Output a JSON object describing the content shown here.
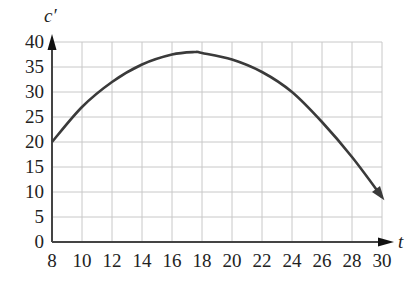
{
  "chart_data": {
    "type": "line",
    "title": "",
    "xlabel": "t",
    "ylabel": "c′",
    "xlim": [
      8,
      30
    ],
    "ylim": [
      0,
      40
    ],
    "x_ticks": [
      "8",
      "10",
      "12",
      "14",
      "16",
      "18",
      "20",
      "22",
      "24",
      "26",
      "28",
      "30"
    ],
    "y_ticks": [
      "0",
      "5",
      "10",
      "15",
      "20",
      "25",
      "30",
      "35",
      "40"
    ],
    "grid": true,
    "legend": null,
    "series": [
      {
        "name": "c′(t)",
        "x": [
          8,
          10,
          12,
          14,
          16,
          17.5,
          18,
          20,
          22,
          24,
          26,
          28,
          30
        ],
        "values": [
          20,
          27,
          32,
          35.5,
          37.5,
          38,
          37.8,
          36.5,
          34,
          30,
          24,
          17,
          9
        ]
      }
    ]
  },
  "colors": {
    "curve": "#3a3a3a",
    "grid": "#c8c8c8",
    "axis": "#444444"
  }
}
